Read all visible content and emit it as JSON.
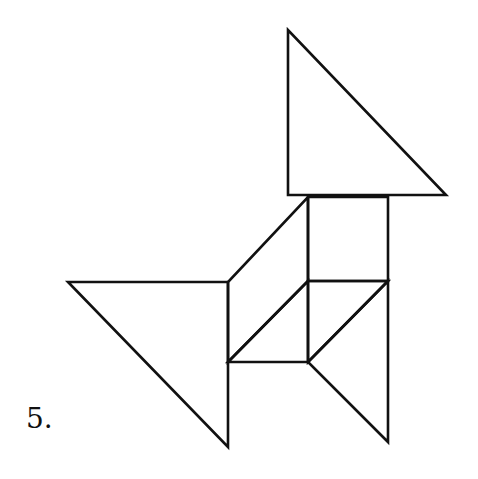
{
  "figure": {
    "label": "5.",
    "stroke_color": "#111111",
    "background_color": "#ffffff",
    "pieces": [
      {
        "name": "large-triangle-top",
        "points": [
          [
            288,
            30
          ],
          [
            288,
            195
          ],
          [
            446,
            195
          ]
        ]
      },
      {
        "name": "square",
        "points": [
          [
            308,
            197
          ],
          [
            388,
            197
          ],
          [
            388,
            281
          ],
          [
            308,
            281
          ]
        ]
      },
      {
        "name": "parallelogram",
        "points": [
          [
            308,
            197
          ],
          [
            308,
            281
          ],
          [
            228,
            362
          ],
          [
            228,
            282
          ]
        ]
      },
      {
        "name": "large-triangle-left",
        "points": [
          [
            68,
            282
          ],
          [
            228,
            282
          ],
          [
            228,
            447
          ]
        ]
      },
      {
        "name": "small-triangle-middle-left",
        "points": [
          [
            308,
            281
          ],
          [
            308,
            362
          ],
          [
            228,
            362
          ]
        ]
      },
      {
        "name": "small-triangle-middle-right",
        "points": [
          [
            308,
            281
          ],
          [
            388,
            281
          ],
          [
            308,
            362
          ]
        ]
      },
      {
        "name": "medium-triangle-bottom-right",
        "points": [
          [
            388,
            281
          ],
          [
            388,
            442
          ],
          [
            308,
            362
          ]
        ]
      }
    ]
  }
}
